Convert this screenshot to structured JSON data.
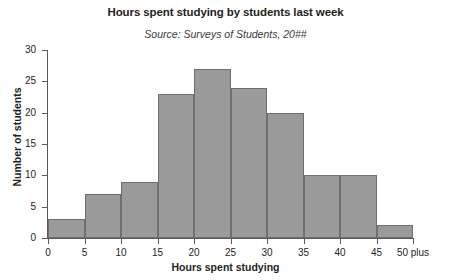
{
  "chart_data": {
    "type": "bar",
    "title": "Hours spent studying by students last week",
    "subtitle": "Source: Surveys of Students, 20##",
    "xlabel": "Hours spent studying",
    "ylabel": "Number of students",
    "grid": false,
    "legend": "none",
    "bar_color": "#9a9a9a",
    "bar_border_color": "#6f6f6f",
    "axis_color": "#58595b",
    "background": "#ffffff",
    "xlim": [
      0,
      50
    ],
    "ylim": [
      0,
      30
    ],
    "ytick_step": 5,
    "xtick_step": 5,
    "bin_width": 5,
    "bin_starts": [
      0,
      5,
      10,
      15,
      20,
      25,
      30,
      35,
      40,
      45
    ],
    "categories": [
      "0-5",
      "5-10",
      "10-15",
      "15-20",
      "20-25",
      "25-30",
      "30-35",
      "35-40",
      "40-45",
      "45-50"
    ],
    "values": [
      3,
      7,
      9,
      23,
      27,
      24,
      20,
      10,
      10,
      2
    ],
    "ytick_labels": [
      "0",
      "5",
      "10",
      "15",
      "20",
      "25",
      "30"
    ],
    "ytick_values": [
      0,
      5,
      10,
      15,
      20,
      25,
      30
    ],
    "xtick_labels": [
      "0",
      "5",
      "10",
      "15",
      "20",
      "25",
      "30",
      "35",
      "40",
      "45",
      "50 plus"
    ],
    "xtick_values": [
      0,
      5,
      10,
      15,
      20,
      25,
      30,
      35,
      40,
      45,
      50
    ]
  }
}
